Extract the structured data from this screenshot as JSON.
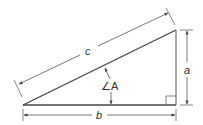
{
  "diagram": {
    "labels": {
      "hypotenuse": "c",
      "adjacent": "b",
      "opposite": "a",
      "angle": "∠A"
    },
    "colors": {
      "triangle": "#333333",
      "dimension": "#555555",
      "background": "#ffffff"
    },
    "icons": [
      "right-angle-marker",
      "arrowhead"
    ]
  }
}
